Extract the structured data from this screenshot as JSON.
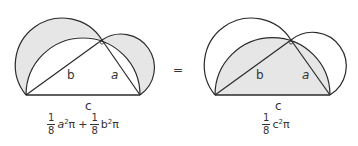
{
  "colors": {
    "shade": "#e6e6e6",
    "stroke": "#2a2a2a",
    "background": "#ffffff"
  },
  "left_figure": {
    "labels": {
      "b": "b",
      "a": "a",
      "c": "c"
    },
    "formula": {
      "term1": {
        "num": "1",
        "den": "8",
        "expr_base": "a",
        "exp": "2",
        "pi": "π"
      },
      "plus": "+",
      "term2": {
        "num": "1",
        "den": "8",
        "expr_base": "b",
        "exp": "2",
        "pi": "π"
      }
    }
  },
  "equals": "=",
  "right_figure": {
    "labels": {
      "b": "b",
      "a": "a",
      "c": "c"
    },
    "formula": {
      "term1": {
        "num": "1",
        "den": "8",
        "expr_base": "c",
        "exp": "2",
        "pi": "π"
      }
    }
  }
}
